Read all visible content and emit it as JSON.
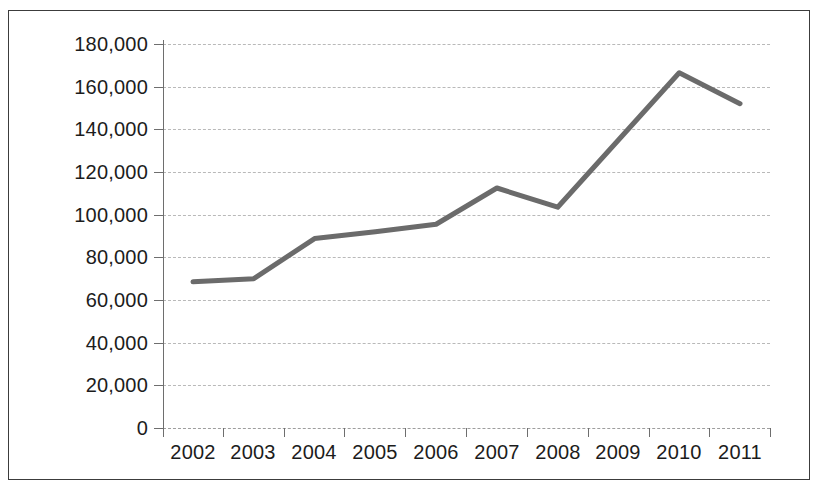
{
  "chart_data": {
    "type": "line",
    "title": "",
    "subtitle": "",
    "xlabel": "",
    "ylabel": "",
    "categories": [
      "2002",
      "2003",
      "2004",
      "2005",
      "2006",
      "2007",
      "2008",
      "2009",
      "2010",
      "2011"
    ],
    "values": [
      68500,
      70000,
      88800,
      92000,
      95500,
      112500,
      103500,
      135000,
      166500,
      152000
    ],
    "series": [
      {
        "name": "",
        "values": [
          68500,
          70000,
          88800,
          92000,
          95500,
          112500,
          103500,
          135000,
          166500,
          152000
        ]
      }
    ],
    "ylim": [
      0,
      180000
    ],
    "ytick_labels": [
      "180,000",
      "160,000",
      "140,000",
      "120,000",
      "100,000",
      "80,000",
      "60,000",
      "40,000",
      "20,000",
      "0"
    ],
    "ytick_values": [
      180000,
      160000,
      140000,
      120000,
      100000,
      80000,
      60000,
      40000,
      20000,
      0
    ],
    "xtick_labels": [
      "2002",
      "2003",
      "2004",
      "2005",
      "2006",
      "2007",
      "2008",
      "2009",
      "2010",
      "2011"
    ],
    "grid": true,
    "grid_style": "dashed-horizontal",
    "legend": false,
    "legend_position": "none",
    "markers": false,
    "line_color": "#6b6b6b",
    "line_width": 5,
    "grid_color": "#b9b9b9",
    "axis_color": "#6e6e6e",
    "text_color": "#1c1c1c",
    "background_color": "#ffffff",
    "border_color": "#3c3c3c",
    "annotations": []
  }
}
